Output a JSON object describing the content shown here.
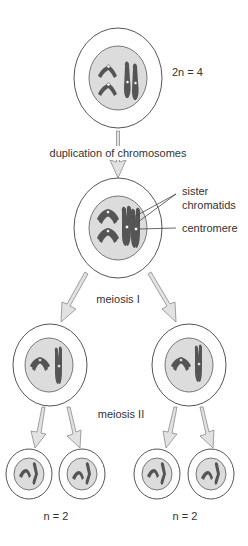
{
  "diagram": {
    "title": "Meiosis",
    "labels": {
      "ploidy_top": "2n = 4",
      "duplication": "duplication of chromosomes",
      "sister_line1": "sister",
      "sister_line2": "chromatids",
      "centromere": "centromere",
      "meiosis1": "meiosis I",
      "meiosis2": "meiosis II",
      "ploidy_bottom_left": "n = 2",
      "ploidy_bottom_right": "n = 2"
    },
    "stages": [
      {
        "name": "parent-cell",
        "chromosomes": 4,
        "ploidy": "2n = 4"
      },
      {
        "name": "duplicated-cell",
        "chromosomes": 4,
        "note": "sister chromatids joined at centromere"
      },
      {
        "name": "meiosis-I-daughters",
        "count": 2
      },
      {
        "name": "meiosis-II-gametes",
        "count": 4,
        "ploidy": "n = 2"
      }
    ],
    "colors": {
      "cell_fill": "#ffffff",
      "nucleus_fill": "#dcdcdc",
      "chromosome": "#555555",
      "arrow_fill": "#e2e2e2",
      "arrow_stroke": "#8a8a8a"
    }
  }
}
